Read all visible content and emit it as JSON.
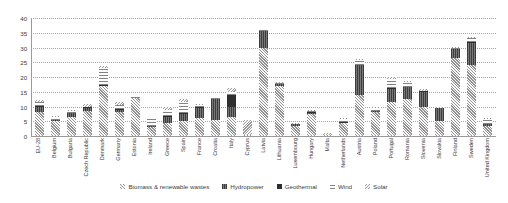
{
  "chart_data": {
    "type": "bar",
    "stacked": true,
    "title": "",
    "xlabel": "",
    "ylabel": "",
    "ylim": [
      0,
      40
    ],
    "ytick_step": 5,
    "yticks": [
      "0",
      "5",
      "10",
      "15",
      "20",
      "25",
      "30",
      "35",
      "40"
    ],
    "grid": true,
    "legend_position": "bottom",
    "categories": [
      "EU-28",
      "Belgium",
      "Bulgaria",
      "Czech Republic",
      "Denmark",
      "Germany",
      "Estonia",
      "Ireland",
      "Greece",
      "Spain",
      "France",
      "Croatia",
      "Italy",
      "Cyprus",
      "Latvia",
      "Lithuania",
      "Luxembourg",
      "Hungary",
      "Malta",
      "Netherlands",
      "Austria",
      "Poland",
      "Portugal",
      "Romania",
      "Slovenia",
      "Slovakia",
      "Finland",
      "Sweden",
      "United Kingdom"
    ],
    "series": [
      {
        "name": "Biomass & renewable wastes",
        "color": "#c9c9c9",
        "values": [
          8.0,
          5.2,
          6.5,
          8.5,
          17.0,
          8.2,
          13.0,
          3.2,
          4.5,
          5.0,
          6.0,
          5.5,
          6.5,
          0.3,
          30.0,
          17.0,
          3.5,
          7.5,
          0.2,
          4.5,
          14.0,
          8.0,
          11.5,
          12.5,
          10.0,
          5.0,
          26.5,
          24.0,
          3.5
        ]
      },
      {
        "name": "Hydropower",
        "color": "#555555",
        "values": [
          2.0,
          0.2,
          1.2,
          1.0,
          0.0,
          0.6,
          0.0,
          0.2,
          2.0,
          2.5,
          3.5,
          7.0,
          3.5,
          0.0,
          5.5,
          0.5,
          0.5,
          0.3,
          0.0,
          0.0,
          10.0,
          0.5,
          4.5,
          4.0,
          5.0,
          4.5,
          3.0,
          7.5,
          0.6
        ]
      },
      {
        "name": "Geothermal",
        "color": "#2f2f2f",
        "values": [
          0.2,
          0.0,
          0.1,
          0.1,
          0.2,
          0.1,
          0.0,
          0.0,
          0.1,
          0.1,
          0.1,
          0.0,
          4.0,
          0.0,
          0.0,
          0.0,
          0.0,
          0.3,
          0.0,
          0.1,
          0.2,
          0.0,
          0.2,
          0.1,
          0.1,
          0.0,
          0.0,
          0.1,
          0.0
        ]
      },
      {
        "name": "Wind",
        "color": "#e0e0e0",
        "values": [
          1.3,
          0.9,
          0.5,
          0.3,
          6.0,
          1.6,
          0.3,
          2.3,
          2.2,
          3.8,
          0.9,
          0.3,
          1.0,
          0.2,
          0.5,
          0.6,
          0.2,
          0.4,
          0.0,
          1.1,
          1.5,
          1.0,
          3.0,
          1.5,
          0.1,
          0.0,
          0.4,
          1.5,
          1.6
        ]
      },
      {
        "name": "Solar",
        "color": "#bfbfbf",
        "values": [
          0.6,
          0.6,
          0.5,
          0.7,
          0.5,
          0.9,
          0.0,
          0.1,
          1.0,
          1.2,
          0.3,
          0.1,
          1.2,
          4.8,
          0.0,
          0.1,
          0.1,
          0.2,
          0.8,
          0.3,
          0.5,
          0.1,
          0.8,
          0.5,
          0.4,
          0.4,
          0.1,
          0.2,
          0.3
        ]
      }
    ]
  },
  "legend": {
    "items": [
      {
        "label": "Biomass & renewable wastes",
        "marker": "biomass-swatch"
      },
      {
        "label": "Hydropower",
        "marker": "hydropower-swatch"
      },
      {
        "label": "Geothermal",
        "marker": "geothermal-swatch"
      },
      {
        "label": "Wind",
        "marker": "wind-swatch"
      },
      {
        "label": "Solar",
        "marker": "solar-swatch"
      }
    ]
  }
}
